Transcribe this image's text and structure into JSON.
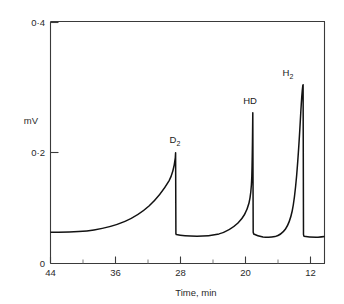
{
  "chart_data": {
    "type": "line",
    "title": "",
    "subtitle": "",
    "xlabel": "Time,   min",
    "ylabel": "mV",
    "x_ticks": [
      {
        "label": "44",
        "value": 44
      },
      {
        "label": "36",
        "value": 36
      },
      {
        "label": "28",
        "value": 28
      },
      {
        "label": "20",
        "value": 20
      },
      {
        "label": "12",
        "value": 12
      }
    ],
    "x_minor_ticks": [
      40,
      32,
      24,
      16
    ],
    "x_axis_reversed": true,
    "xlim": [
      44,
      10
    ],
    "y_ticks": [
      {
        "label": "0",
        "value": 0
      },
      {
        "label": "0·2",
        "value": 0.2
      },
      {
        "label": "0·4",
        "value": 0.4
      }
    ],
    "ylim": [
      0,
      0.42
    ],
    "grid": false,
    "legend_position": "none",
    "annotations": [
      {
        "text": "D2",
        "display": "D₂",
        "x": 28.2,
        "y": 0.2
      },
      {
        "text": "HD",
        "display": "HD",
        "x": 17.5,
        "y": 0.27
      },
      {
        "text": "H2",
        "display": "H₂",
        "x": 13.2,
        "y": 0.31
      }
    ],
    "peaks": [
      {
        "name": "D₂",
        "retention_time_min": 28.0,
        "height_mV": 0.195,
        "baseline_mV": 0.075
      },
      {
        "name": "HD",
        "retention_time_min": 17.7,
        "height_mV": 0.262,
        "baseline_mV": 0.072
      },
      {
        "name": "H₂",
        "retention_time_min": 13.5,
        "height_mV": 0.305,
        "baseline_mV": 0.068
      }
    ],
    "baseline_mV": 0.072,
    "series": [
      {
        "name": "detector-signal",
        "x": [
          44.0,
          43.0,
          42.0,
          41.0,
          40.0,
          39.0,
          38.0,
          37.0,
          36.0,
          35.0,
          34.2,
          33.4,
          32.6,
          31.8,
          31.0,
          30.4,
          29.8,
          29.3,
          28.9,
          28.6,
          28.35,
          28.15,
          28.0,
          28.0,
          27.98,
          27.6,
          27.0,
          26.2,
          25.2,
          24.2,
          23.2,
          22.2,
          21.4,
          20.6,
          20.0,
          19.4,
          18.9,
          18.5,
          18.2,
          17.95,
          17.78,
          17.7,
          17.7,
          17.66,
          17.4,
          17.0,
          16.6,
          16.2,
          15.8,
          15.4,
          15.0,
          14.7,
          14.4,
          14.1,
          13.9,
          13.72,
          13.58,
          13.5,
          13.5,
          13.46,
          13.2,
          12.8,
          12.4,
          12.0,
          11.4,
          10.8,
          10.0
        ],
        "y": [
          0.0745,
          0.0745,
          0.0748,
          0.0752,
          0.0758,
          0.0766,
          0.0778,
          0.0794,
          0.0815,
          0.0845,
          0.0878,
          0.092,
          0.0975,
          0.1045,
          0.1135,
          0.1225,
          0.1335,
          0.1455,
          0.158,
          0.17,
          0.1805,
          0.189,
          0.195,
          0.0755,
          0.0742,
          0.073,
          0.0722,
          0.072,
          0.0722,
          0.0732,
          0.0755,
          0.0795,
          0.085,
          0.093,
          0.1015,
          0.113,
          0.127,
          0.143,
          0.162,
          0.188,
          0.223,
          0.262,
          0.076,
          0.073,
          0.07,
          0.0685,
          0.0685,
          0.07,
          0.0735,
          0.08,
          0.0905,
          0.103,
          0.12,
          0.145,
          0.172,
          0.21,
          0.262,
          0.305,
          0.07,
          0.0675,
          0.0662,
          0.066,
          0.0662,
          0.0665,
          0.067,
          0.0675,
          0.068
        ]
      }
    ]
  },
  "axes": {
    "x_title": "Time,   min",
    "y_title": "mV"
  }
}
